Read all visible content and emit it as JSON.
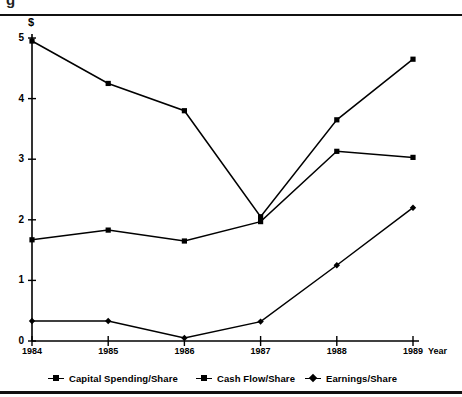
{
  "figure": {
    "unit_label": "$",
    "cut_glyph": "g"
  },
  "chart_data": {
    "type": "line",
    "title": "",
    "xlabel": "Year",
    "ylabel": "$",
    "categories": [
      "1984",
      "1985",
      "1986",
      "1987",
      "1988",
      "1989"
    ],
    "x": [
      1984,
      1985,
      1986,
      1987,
      1988,
      1989
    ],
    "xlim": [
      1984,
      1989
    ],
    "ylim": [
      0,
      5
    ],
    "yticks": [
      "0",
      "1",
      "2",
      "3",
      "4",
      "5"
    ],
    "ytick_values": [
      0,
      1,
      2,
      3,
      4,
      5
    ],
    "grid": false,
    "legend_position": "bottom",
    "series": [
      {
        "name": "Capital Spending/Share",
        "marker": "square",
        "color": "#000000",
        "values": [
          4.95,
          4.25,
          3.8,
          2.05,
          3.65,
          4.65
        ]
      },
      {
        "name": "Cash Flow/Share",
        "marker": "square",
        "color": "#000000",
        "values": [
          1.67,
          1.83,
          1.65,
          1.97,
          3.13,
          3.03
        ]
      },
      {
        "name": "Earnings/Share",
        "marker": "diamond",
        "color": "#000000",
        "values": [
          0.33,
          0.33,
          0.05,
          0.32,
          1.25,
          2.2
        ]
      }
    ]
  }
}
